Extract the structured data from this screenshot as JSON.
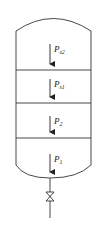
{
  "diagram": {
    "type": "pressure-vessel-schematic",
    "stroke_color": "#333333",
    "background": "#ffffff",
    "sections": 4,
    "labels": [
      {
        "id": "ps2",
        "main": "P",
        "sub": "s2"
      },
      {
        "id": "ps1",
        "main": "P",
        "sub": "s1"
      },
      {
        "id": "p2",
        "main": "P",
        "sub": "2"
      },
      {
        "id": "p1",
        "main": "P",
        "sub": "1"
      }
    ],
    "components": [
      "top-head",
      "shell",
      "partition-1",
      "partition-2",
      "partition-3",
      "bottom-head",
      "outlet-pipe",
      "valve"
    ]
  }
}
